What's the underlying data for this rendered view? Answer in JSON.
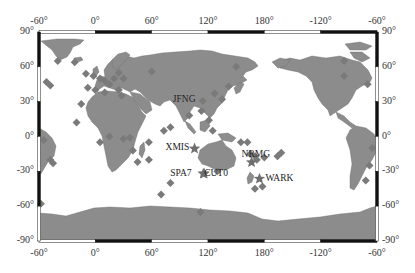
{
  "map": {
    "projection": "cylindrical",
    "lon_range": [
      -60,
      300
    ],
    "lat_range": [
      -90,
      90
    ],
    "colors": {
      "land": "#8c8c8c",
      "ocean": "#ffffff",
      "marker": "#7a7a7a",
      "star": "#6e6e6e",
      "frame_dark": "#111111"
    },
    "axes": {
      "top_ticks": [
        "-60°",
        "0°",
        "60°",
        "120°",
        "180°",
        "-120°",
        "-60°"
      ],
      "bottom_ticks": [
        "-60°",
        "0°",
        "60°",
        "120°",
        "180°",
        "-120°",
        "-60°"
      ],
      "left_ticks": [
        "90°",
        "60°",
        "30°",
        "0°",
        "-30°",
        "-60°",
        "-90°"
      ],
      "right_ticks": [
        "90°",
        "60°",
        "30°",
        "0°",
        "-30°",
        "-60°",
        "-90°"
      ]
    },
    "labeled_stations": [
      {
        "name": "JFNG",
        "lon": 114.5,
        "lat": 30.5,
        "marker": "diamond"
      },
      {
        "name": "XMIS",
        "lon": 105.7,
        "lat": -10.4,
        "marker": "star"
      },
      {
        "name": "NRMG",
        "lon": 166.4,
        "lat": -22.2,
        "marker": "star"
      },
      {
        "name": "SPA7",
        "lon": 115.0,
        "lat": -32.0,
        "marker": "star"
      },
      {
        "name": "CUT0",
        "lon": 115.9,
        "lat": -32.0,
        "marker": "star"
      },
      {
        "name": "WARK",
        "lon": 174.8,
        "lat": -36.4,
        "marker": "star"
      }
    ],
    "other_station_count": 60
  }
}
